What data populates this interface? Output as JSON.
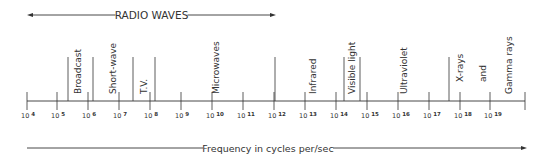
{
  "radio_waves": {
    "label": "RADIO WAVES",
    "x_start": 27,
    "x_end": 276
  },
  "axis": {
    "label": "Frequency in cycles per/sec",
    "ticks": [
      {
        "base": "10",
        "exp": "4",
        "x": 27
      },
      {
        "base": "10",
        "exp": "5",
        "x": 57
      },
      {
        "base": "10",
        "exp": "6",
        "x": 88
      },
      {
        "base": "10",
        "exp": "7",
        "x": 119
      },
      {
        "base": "10",
        "exp": "8",
        "x": 150
      },
      {
        "base": "10",
        "exp": "9",
        "x": 181
      },
      {
        "base": "10",
        "exp": "10",
        "x": 212
      },
      {
        "base": "10",
        "exp": "11",
        "x": 243
      },
      {
        "base": "10",
        "exp": "12",
        "x": 274
      },
      {
        "base": "10",
        "exp": "13",
        "x": 305
      },
      {
        "base": "10",
        "exp": "14",
        "x": 336
      },
      {
        "base": "10",
        "exp": "15",
        "x": 367
      },
      {
        "base": "10",
        "exp": "16",
        "x": 398
      },
      {
        "base": "10",
        "exp": "17",
        "x": 429
      },
      {
        "base": "10",
        "exp": "18",
        "x": 460
      },
      {
        "base": "10",
        "exp": "19",
        "x": 490
      }
    ],
    "end_tick_x": 525
  },
  "dividers": [
    68,
    93,
    133,
    155,
    275,
    344,
    360,
    449
  ],
  "bands": [
    {
      "label": "Broadcast",
      "x": 81,
      "y": 94
    },
    {
      "label": "Short-wave",
      "x": 116,
      "y": 94
    },
    {
      "label": "T.V.",
      "x": 147,
      "y": 94
    },
    {
      "label": "Microwaves",
      "x": 219,
      "y": 94
    },
    {
      "label": "Infrared",
      "x": 316,
      "y": 94
    },
    {
      "label": "Visible light",
      "x": 355,
      "y": 94
    },
    {
      "label": "Ultraviolet",
      "x": 407,
      "y": 94
    },
    {
      "label": "X-rays",
      "x": 463,
      "y": 82
    },
    {
      "label": "and",
      "x": 486,
      "y": 82
    },
    {
      "label": "Gamma rays",
      "x": 512,
      "y": 94
    }
  ]
}
